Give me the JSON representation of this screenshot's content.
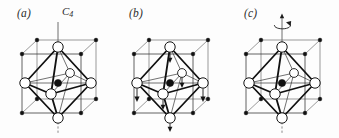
{
  "figure": {
    "background_color": "#fdfdfd",
    "line_color": "#1a1a1a",
    "ligand_fill": "#ffffff",
    "center_atom_color": "#101010",
    "corner_atom_color": "#111111"
  },
  "panels": [
    {
      "id": "a",
      "label": "(a)",
      "axis_label": "C",
      "axis_subscript": "4",
      "axis_label_full": "C4",
      "has_axis_line": true,
      "has_displacement_arrows": false,
      "has_rotation_arrow": false,
      "description": "Undistorted octahedron inside cubic cell with vertical C4 rotation axis drawn"
    },
    {
      "id": "b",
      "label": "(b)",
      "axis_label": "",
      "axis_subscript": "",
      "axis_label_full": "",
      "has_axis_line": false,
      "has_displacement_arrows": true,
      "has_rotation_arrow": false,
      "description": "Octahedron with downward displacement arrows on ligand and corner atoms"
    },
    {
      "id": "c",
      "label": "(c)",
      "axis_label": "",
      "axis_subscript": "",
      "axis_label_full": "",
      "has_axis_line": true,
      "has_displacement_arrows": false,
      "has_rotation_arrow": true,
      "description": "Octahedron with curved rotation arrow about the vertical axis"
    }
  ],
  "geometry": {
    "cube": {
      "front_top_left": [
        22,
        54
      ],
      "front_top_right": [
        81,
        54
      ],
      "front_bottom_left": [
        22,
        113
      ],
      "front_bottom_right": [
        81,
        113
      ],
      "back_top_left": [
        37,
        40
      ],
      "back_top_right": [
        96,
        40
      ],
      "back_bottom_left": [
        37,
        99
      ],
      "back_bottom_right": [
        96,
        99
      ]
    },
    "octahedron": {
      "top": [
        58,
        47
      ],
      "bottom": [
        58,
        118
      ],
      "left": [
        25,
        83
      ],
      "right": [
        91,
        83
      ],
      "front": [
        51,
        94
      ],
      "back": [
        70,
        73
      ],
      "center": [
        58,
        83
      ]
    },
    "ligand_radius_large": 5.2,
    "ligand_radius_small": 4.4,
    "center_radius": 3.6,
    "corner_dot_radius": 1.9
  }
}
